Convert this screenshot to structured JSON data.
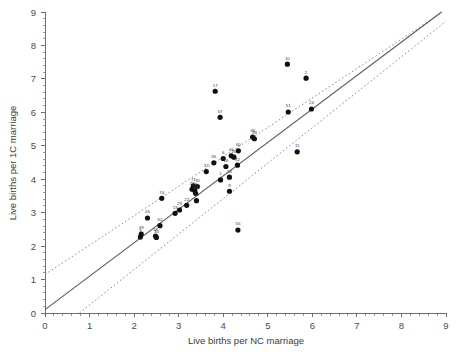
{
  "chart_data": {
    "type": "scatter",
    "title": "",
    "xlabel": "Live births per NC marriage",
    "ylabel": "Live births per 1C marriage",
    "xlim": [
      0,
      9
    ],
    "ylim": [
      0,
      9
    ],
    "xticks": [
      0,
      1,
      2,
      3,
      4,
      5,
      6,
      7,
      8,
      9
    ],
    "yticks": [
      0,
      1,
      2,
      3,
      4,
      5,
      6,
      7,
      8,
      9
    ],
    "minor_tick_step": 0.2,
    "grid": false,
    "legend": "none",
    "points": [
      {
        "label": "10",
        "x": 5.44,
        "y": 7.44
      },
      {
        "label": "2",
        "x": 5.86,
        "y": 7.02
      },
      {
        "label": "17",
        "x": 3.82,
        "y": 6.63
      },
      {
        "label": "67",
        "x": 3.93,
        "y": 5.85
      },
      {
        "label": "51",
        "x": 5.46,
        "y": 6.01
      },
      {
        "label": "24",
        "x": 5.98,
        "y": 6.1
      },
      {
        "label": "36",
        "x": 4.66,
        "y": 5.26
      },
      {
        "label": "38",
        "x": 4.7,
        "y": 5.21
      },
      {
        "label": "60",
        "x": 4.34,
        "y": 4.85
      },
      {
        "label": "11",
        "x": 5.66,
        "y": 4.82
      },
      {
        "label": "46",
        "x": 4.18,
        "y": 4.7
      },
      {
        "label": "26",
        "x": 4.24,
        "y": 4.66
      },
      {
        "label": "6",
        "x": 4.0,
        "y": 4.62
      },
      {
        "label": "65",
        "x": 3.79,
        "y": 4.49
      },
      {
        "label": "32",
        "x": 4.32,
        "y": 4.42
      },
      {
        "label": "16",
        "x": 4.06,
        "y": 4.38
      },
      {
        "label": "37",
        "x": 3.62,
        "y": 4.23
      },
      {
        "label": "1",
        "x": 3.94,
        "y": 3.98
      },
      {
        "label": "34",
        "x": 4.14,
        "y": 4.06
      },
      {
        "label": "9",
        "x": 4.14,
        "y": 3.64
      },
      {
        "label": "71",
        "x": 3.33,
        "y": 3.8
      },
      {
        "label": "70",
        "x": 3.42,
        "y": 3.78
      },
      {
        "label": "73",
        "x": 3.3,
        "y": 3.7
      },
      {
        "label": "19",
        "x": 3.36,
        "y": 3.66
      },
      {
        "label": "44",
        "x": 3.38,
        "y": 3.58
      },
      {
        "label": "74",
        "x": 2.62,
        "y": 3.43
      },
      {
        "label": "21",
        "x": 3.4,
        "y": 3.36
      },
      {
        "label": "22",
        "x": 3.18,
        "y": 3.22
      },
      {
        "label": "29",
        "x": 3.02,
        "y": 3.08
      },
      {
        "label": "13",
        "x": 2.92,
        "y": 2.98
      },
      {
        "label": "45",
        "x": 2.3,
        "y": 2.84
      },
      {
        "label": "62",
        "x": 2.58,
        "y": 2.61
      },
      {
        "label": "55",
        "x": 4.33,
        "y": 2.48
      },
      {
        "label": "49",
        "x": 2.16,
        "y": 2.36
      },
      {
        "label": "3",
        "x": 2.14,
        "y": 2.27
      },
      {
        "label": "58",
        "x": 2.48,
        "y": 2.3
      },
      {
        "label": "30",
        "x": 2.5,
        "y": 2.26
      }
    ],
    "fit_line": {
      "slope": 1.0,
      "intercept": 0.1,
      "style": "solid"
    },
    "confidence_bands": [
      {
        "slope": 0.88,
        "intercept": 1.15,
        "style": "dotted"
      },
      {
        "slope": 1.06,
        "intercept": -0.82,
        "style": "dotted"
      }
    ]
  },
  "caption": {
    "fragment": ""
  }
}
